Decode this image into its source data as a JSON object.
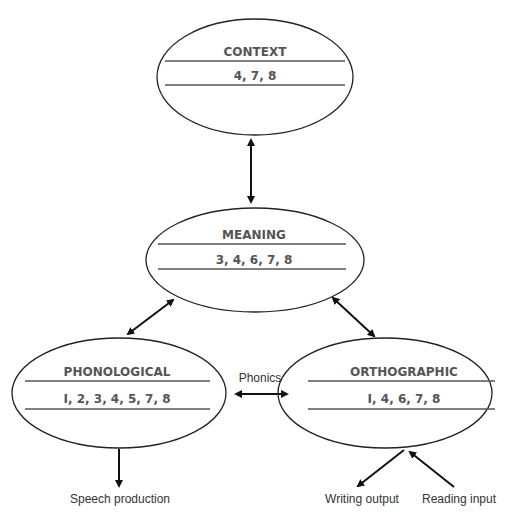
{
  "nodes": {
    "context": {
      "title": "CONTEXT",
      "numbers": "4, 7, 8"
    },
    "meaning": {
      "title": "MEANING",
      "numbers": "3, 4, 6, 7, 8"
    },
    "phonological": {
      "title": "PHONOLOGICAL",
      "numbers": "I, 2, 3, 4, 5, 7, 8"
    },
    "orthographic": {
      "title": "ORTHOGRAPHIC",
      "numbers": "I, 4, 6, 7, 8"
    }
  },
  "labels": {
    "phonics": "Phonics",
    "speech_production": "Speech production",
    "writing_output": "Writing output",
    "reading_input": "Reading input"
  },
  "colors": {
    "stroke": "#222222",
    "text": "#555555"
  }
}
